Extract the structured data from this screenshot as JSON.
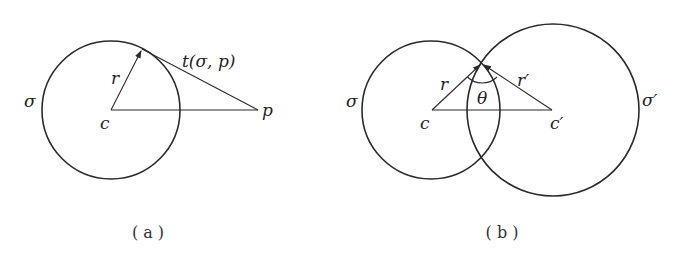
{
  "figure_a": {
    "caption": "( a )",
    "circle_label": "σ",
    "radius_label": "r",
    "center_label": "c",
    "point_label": "p",
    "tangent_label": "t(σ, p)"
  },
  "figure_b": {
    "caption": "( b )",
    "circle1_label": "σ",
    "circle2_label": "σ′",
    "radius1_label": "r",
    "radius2_label": "r′",
    "center1_label": "c",
    "center2_label": "c′",
    "angle_label": "θ"
  },
  "colors": {
    "stroke": "#2a2a2a",
    "background": "#ffffff"
  }
}
